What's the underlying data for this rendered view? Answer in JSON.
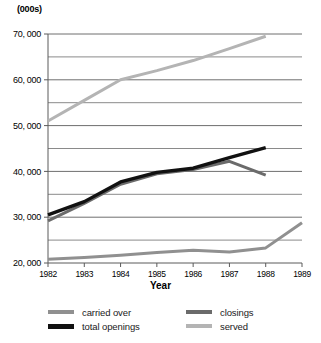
{
  "units_label": "(000s)",
  "xaxis_title": "Year",
  "legend": {
    "entries": [
      {
        "label": "carried over",
        "color": "#909090",
        "key": "carried_over"
      },
      {
        "label": "total openings",
        "color": "#111111",
        "key": "total_openings"
      },
      {
        "label": "closings",
        "color": "#6b6b6b",
        "key": "closings"
      },
      {
        "label": "served",
        "color": "#b4b4b4",
        "key": "served"
      }
    ]
  },
  "chart_data": {
    "type": "line",
    "title": "",
    "xlabel": "Year",
    "ylabel": "(000s)",
    "grid": true,
    "legend_position": "bottom",
    "x": [
      1982,
      1983,
      1984,
      1985,
      1986,
      1987,
      1988,
      1989
    ],
    "xtick_labels": [
      "1982",
      "1983",
      "1984",
      "1985",
      "1986",
      "1987",
      "1988",
      "1989"
    ],
    "xlim": [
      1982,
      1989
    ],
    "ylim": [
      20000,
      70000
    ],
    "ytick_values": [
      20000,
      30000,
      40000,
      50000,
      60000,
      70000
    ],
    "ytick_labels": [
      "20, 000",
      "30, 000",
      "40, 000",
      "50, 000",
      "60, 000",
      "70, 000"
    ],
    "minor_gridline_values": [
      25000,
      35000,
      45000,
      55000,
      65000
    ],
    "series": [
      {
        "name": "served",
        "color": "#b4b4b4",
        "x": [
          1982,
          1983,
          1984,
          1985,
          1986,
          1987,
          1988
        ],
        "values": [
          51000,
          55500,
          60000,
          62000,
          64200,
          66800,
          69500
        ]
      },
      {
        "name": "total openings",
        "color": "#111111",
        "x": [
          1982,
          1983,
          1984,
          1985,
          1986,
          1987,
          1988
        ],
        "values": [
          30500,
          33400,
          37700,
          39800,
          40700,
          43000,
          45200
        ]
      },
      {
        "name": "closings",
        "color": "#6b6b6b",
        "x": [
          1982,
          1983,
          1984,
          1985,
          1986,
          1987,
          1988
        ],
        "values": [
          29200,
          33000,
          37200,
          39500,
          40400,
          42200,
          39200
        ]
      },
      {
        "name": "carried over",
        "color": "#909090",
        "x": [
          1982,
          1983,
          1984,
          1985,
          1986,
          1987,
          1988,
          1989
        ],
        "values": [
          20800,
          21200,
          21700,
          22300,
          22800,
          22400,
          23300,
          28800
        ]
      }
    ]
  }
}
